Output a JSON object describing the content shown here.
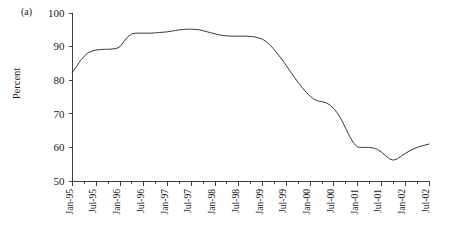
{
  "figure": {
    "panel_label": "(a)",
    "ylabel": "Percent"
  },
  "chart_data": {
    "type": "line",
    "title": "",
    "xlabel": "",
    "ylabel": "Percent",
    "ylim": [
      50,
      100
    ],
    "yticks": [
      50,
      60,
      70,
      80,
      90,
      100
    ],
    "grid": false,
    "legend": null,
    "xtick_labels": [
      "Jan-95",
      "Jul-95",
      "Jan-96",
      "Jul-96",
      "Jan-97",
      "Jul-97",
      "Jan-98",
      "Jul-98",
      "Jan-99",
      "Jul-99",
      "Jan-00",
      "Jul-00",
      "Jan-01",
      "Jul-01",
      "Jan-02",
      "Jul-02"
    ],
    "x": [
      "Jan-95",
      "Feb-95",
      "Mar-95",
      "Apr-95",
      "May-95",
      "Jun-95",
      "Jul-95",
      "Aug-95",
      "Sep-95",
      "Oct-95",
      "Nov-95",
      "Dec-95",
      "Jan-96",
      "Feb-96",
      "Mar-96",
      "Apr-96",
      "May-96",
      "Jun-96",
      "Jul-96",
      "Aug-96",
      "Sep-96",
      "Oct-96",
      "Nov-96",
      "Dec-96",
      "Jan-97",
      "Feb-97",
      "Mar-97",
      "Apr-97",
      "May-97",
      "Jun-97",
      "Jul-97",
      "Aug-97",
      "Sep-97",
      "Oct-97",
      "Nov-97",
      "Dec-97",
      "Jan-98",
      "Feb-98",
      "Mar-98",
      "Apr-98",
      "May-98",
      "Jun-98",
      "Jul-98",
      "Aug-98",
      "Sep-98",
      "Oct-98",
      "Nov-98",
      "Dec-98",
      "Jan-99",
      "Feb-99",
      "Mar-99",
      "Apr-99",
      "May-99",
      "Jun-99",
      "Jul-99",
      "Aug-99",
      "Sep-99",
      "Oct-99",
      "Nov-99",
      "Dec-99",
      "Jan-00",
      "Feb-00",
      "Mar-00",
      "Apr-00",
      "May-00",
      "Jun-00",
      "Jul-00",
      "Aug-00",
      "Sep-00",
      "Oct-00",
      "Nov-00",
      "Dec-00",
      "Jan-01",
      "Feb-01",
      "Mar-01",
      "Apr-01",
      "May-01",
      "Jun-01",
      "Jul-01",
      "Aug-01",
      "Sep-01",
      "Oct-01",
      "Nov-01",
      "Dec-01",
      "Jan-02",
      "Feb-02",
      "Mar-02",
      "Apr-02",
      "May-02",
      "Jun-02",
      "Jul-02"
    ],
    "values": [
      82.4,
      84.0,
      85.8,
      87.2,
      88.2,
      88.7,
      89.0,
      89.1,
      89.2,
      89.2,
      89.3,
      89.4,
      90.0,
      91.5,
      93.0,
      93.8,
      94.0,
      94.0,
      94.0,
      94.0,
      94.0,
      94.1,
      94.2,
      94.3,
      94.4,
      94.6,
      94.8,
      95.0,
      95.1,
      95.2,
      95.2,
      95.1,
      95.0,
      94.7,
      94.4,
      94.1,
      93.8,
      93.5,
      93.3,
      93.2,
      93.1,
      93.1,
      93.1,
      93.1,
      93.1,
      93.0,
      92.9,
      92.6,
      92.2,
      91.4,
      90.3,
      89.0,
      87.5,
      86.0,
      84.3,
      82.6,
      80.9,
      79.3,
      77.8,
      76.4,
      75.2,
      74.3,
      73.8,
      73.6,
      73.3,
      72.6,
      71.5,
      70.0,
      68.0,
      65.6,
      63.2,
      61.2,
      60.1,
      60.0,
      60.0,
      60.0,
      59.8,
      59.4,
      58.6,
      57.6,
      56.6,
      56.2,
      56.6,
      57.4,
      58.2,
      58.9,
      59.5,
      60.0,
      60.4,
      60.7,
      61.0
    ]
  }
}
